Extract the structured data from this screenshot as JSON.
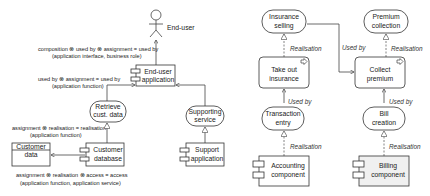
{
  "left_diagram": {
    "actor": {
      "label": "End-user"
    },
    "end_user_app": {
      "line1": "End-user",
      "line2": "application"
    },
    "retrieve": {
      "line1": "Retrieve",
      "line2": "cust. data"
    },
    "supporting_service": {
      "line1": "Supporting",
      "line2": "service"
    },
    "customer_data": {
      "line1": "Customer",
      "line2": "data"
    },
    "customer_db": {
      "line1": "Customer",
      "line2": "database"
    },
    "support_app": {
      "line1": "Support",
      "line2": "application"
    },
    "annotations": {
      "a1_line1": "composition ⊗ used by ⊗ assignment = used by",
      "a1_line2": "(application interface, business role)",
      "a2_line1": "used by ⊗ assignment = used by",
      "a2_line2": "(application function)",
      "a3_line1": "assignment ⊗ realisation = realisation",
      "a3_line2": "(application function)",
      "a4_line1": "assignment ⊗ realisation ⊗ access = access",
      "a4_line2": "(application function, application service)"
    }
  },
  "right_diagram": {
    "insurance_selling": {
      "line1": "Insurance",
      "line2": "selling"
    },
    "premium_collection": {
      "line1": "Premium",
      "line2": "collection"
    },
    "take_out": {
      "line1": "Take out",
      "line2": "insurance"
    },
    "collect_premium": {
      "line1": "Collect",
      "line2": "premium"
    },
    "transaction_entry": {
      "line1": "Transaction",
      "line2": "entry"
    },
    "bill_creation": {
      "line1": "Bill",
      "line2": "creation"
    },
    "accounting": {
      "line1": "Accounting",
      "line2": "component"
    },
    "billing": {
      "line1": "Billing",
      "line2": "component"
    },
    "relations": {
      "realisation": "Realisation",
      "used_by": "Used by"
    },
    "colors": {
      "billing_fill": "#f0f0f0"
    }
  }
}
